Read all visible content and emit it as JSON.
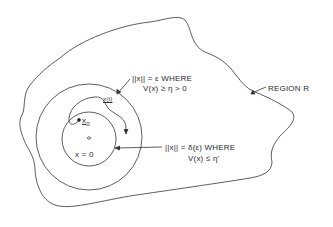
{
  "diagram": {
    "region_label": "REGION  R",
    "outer_circle_label": {
      "line1_prefix": "||x|| = ",
      "line1_symbol": "ε",
      "line1_suffix": " WHERE",
      "line2": "V(x) ≥ η > 0"
    },
    "inner_circle_label": {
      "line1": "||x|| = δ(ε) WHERE",
      "line2": "V(x) ≤ η'"
    },
    "trajectory_label": "x(t)",
    "initial_point_label": "x",
    "initial_point_subscript": "0",
    "origin_label": "x = 0",
    "colors": {
      "stroke": "#333333",
      "background": "#ffffff"
    }
  }
}
